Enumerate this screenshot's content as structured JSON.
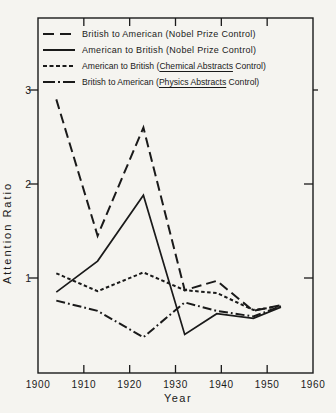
{
  "figure": {
    "background": "#f5f4f0",
    "line_color": "#1a1a1a"
  },
  "axes": {
    "y_label": "Attention Ratio",
    "x_label": "Year",
    "y_ticks": [
      "1",
      "2",
      "3"
    ],
    "x_ticks": [
      "1900",
      "1910",
      "1920",
      "1930",
      "1940",
      "1950",
      "1960"
    ]
  },
  "chart_data": {
    "type": "line",
    "xlabel": "Year",
    "ylabel": "Attention Ratio",
    "xlim": [
      1900,
      1960
    ],
    "ylim": [
      0,
      3.2
    ],
    "grid": false,
    "legend_position": "top-inside",
    "x": [
      1904,
      1913,
      1923,
      1932,
      1939,
      1947,
      1953
    ],
    "series": [
      {
        "id": "british-american-nobel",
        "name": "British to American (Nobel Prize Control)",
        "line_style": "long-dash",
        "dash": "10 5",
        "legend_dash": "11 6",
        "width": 2,
        "values": [
          2.9,
          1.45,
          2.6,
          0.87,
          0.97,
          0.65,
          0.71
        ],
        "legend": {
          "pre": "British to American (Nobel Prize Control)",
          "underline": "",
          "post": ""
        }
      },
      {
        "id": "american-british-nobel",
        "name": "American to British (Nobel Prize Control)",
        "line_style": "solid",
        "dash": "",
        "legend_dash": "",
        "width": 1.7,
        "values": [
          0.85,
          1.18,
          1.88,
          0.4,
          0.62,
          0.57,
          0.69
        ],
        "legend": {
          "pre": "American to British (Nobel Prize Control)",
          "underline": "",
          "post": ""
        }
      },
      {
        "id": "american-british-chem-abstracts",
        "name": "American to British (Chemical Abstracts Control)",
        "line_style": "short-dash",
        "dash": "3.5 2.5",
        "legend_dash": "4 2.5",
        "width": 2,
        "values": [
          1.05,
          0.86,
          1.06,
          0.87,
          0.84,
          0.66,
          0.7
        ],
        "legend": {
          "pre": "American to British (",
          "underline": "Chemical Abstracts",
          "post": " Control)"
        }
      },
      {
        "id": "british-american-physics-abstracts",
        "name": "British to American (Physics Abstracts Control)",
        "line_style": "dash-dot",
        "dash": "9 3 1.8 3",
        "legend_dash": "12 3 2 3",
        "width": 2,
        "values": [
          0.76,
          0.65,
          0.37,
          0.74,
          0.65,
          0.59,
          0.7
        ],
        "legend": {
          "pre": "British to American (",
          "underline": "Physics Abstracts",
          "post": " Control)"
        }
      }
    ]
  }
}
